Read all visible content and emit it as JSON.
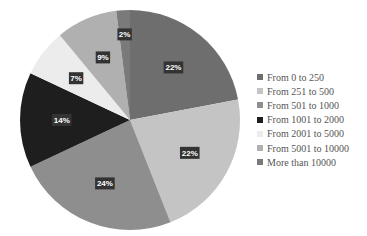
{
  "chart_data": {
    "type": "pie",
    "title": "",
    "categories": [
      "From 0 to 250",
      "From 251 to 500",
      "From 501 to 1000",
      "From 1001 to 2000",
      "From 2001 to 5000",
      "From 5001 to 10000",
      "More than 10000"
    ],
    "values": [
      22,
      22,
      24,
      14,
      7,
      9,
      2
    ],
    "labels": [
      "22%",
      "22%",
      "24%",
      "14%",
      "7%",
      "9%",
      "2%"
    ],
    "colors": [
      "#6e6e6e",
      "#c4c4c4",
      "#8e8e8e",
      "#1e1e1e",
      "#ececec",
      "#b0b0b0",
      "#7a7a7a"
    ],
    "legend_position": "right",
    "start_angle_deg": 0,
    "direction": "clockwise"
  },
  "legend": {
    "items": [
      {
        "label": "From 0 to 250",
        "color": "#6e6e6e"
      },
      {
        "label": "From 251 to 500",
        "color": "#c4c4c4"
      },
      {
        "label": "From 501 to 1000",
        "color": "#8e8e8e"
      },
      {
        "label": "From 1001 to 2000",
        "color": "#1e1e1e"
      },
      {
        "label": "From 2001 to 5000",
        "color": "#ececec"
      },
      {
        "label": "From 5001 to 10000",
        "color": "#b0b0b0"
      },
      {
        "label": "More than 10000",
        "color": "#7a7a7a"
      }
    ]
  }
}
